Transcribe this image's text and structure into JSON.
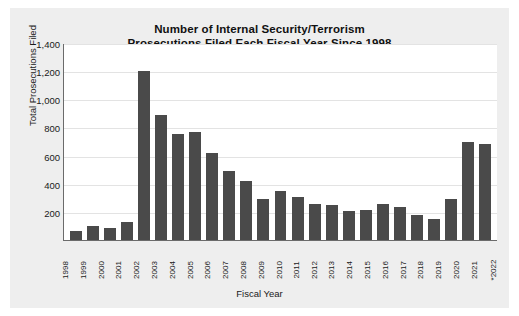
{
  "chart_data": {
    "type": "bar",
    "title": "Number of Internal Security/Terrorism Prosecutions Filed Each Fiscal Year Since 1998",
    "title_line1": "Number of Internal Security/Terrorism",
    "title_line2": "Prosecutions Filed Each Fiscal Year Since 1998",
    "xlabel": "Fiscal Year",
    "ylabel": "Total Prosecutions Filed",
    "categories": [
      "1998",
      "1999",
      "2000",
      "2001",
      "2002",
      "2003",
      "2004",
      "2005",
      "2006",
      "2007",
      "2008",
      "2009",
      "2010",
      "2011",
      "2012",
      "2013",
      "2014",
      "2015",
      "2016",
      "2017",
      "2018",
      "2019",
      "2020",
      "2021",
      "*2022"
    ],
    "values": [
      65,
      100,
      85,
      125,
      1200,
      890,
      750,
      765,
      615,
      490,
      420,
      290,
      350,
      305,
      255,
      250,
      205,
      215,
      255,
      235,
      180,
      150,
      290,
      700,
      685
    ],
    "ylim": [
      0,
      1400
    ],
    "yticks": [
      "200",
      "400",
      "600",
      "800",
      "1,000",
      "1,200",
      "1,400"
    ],
    "ytick_values": [
      200,
      400,
      600,
      800,
      1000,
      1200,
      1400
    ],
    "grid": true,
    "legend": "none",
    "bar_color": "#4a4a4a",
    "plot_background": "#ffffff",
    "figure_background": "#eeeeee"
  }
}
